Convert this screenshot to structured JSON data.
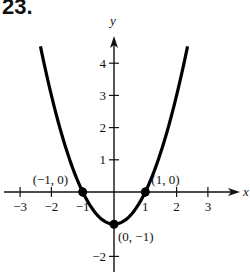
{
  "problem_number": "23.",
  "chart_data": {
    "type": "line",
    "title": "",
    "function": "y = x^2 - 1",
    "xlabel": "x",
    "ylabel": "y",
    "xlim": [
      -3.5,
      4
    ],
    "ylim": [
      -2.5,
      4.8
    ],
    "grid": false,
    "x_ticks": [
      -3,
      -2,
      -1,
      1,
      2,
      3
    ],
    "x_tick_labels": [
      "−3",
      "−2",
      "−1",
      "1",
      "2",
      "3"
    ],
    "y_ticks": [
      -2,
      1,
      2,
      3,
      4
    ],
    "y_tick_labels": [
      "−2",
      "1",
      "2",
      "3",
      "4"
    ],
    "series": [
      {
        "name": "parabola",
        "x": [
          -2.35,
          -2,
          -1.5,
          -1,
          -0.5,
          0,
          0.5,
          1,
          1.5,
          2,
          2.35
        ],
        "y": [
          4.52,
          3,
          1.25,
          0,
          -0.75,
          -1,
          -0.75,
          0,
          1.25,
          3,
          4.52
        ]
      }
    ],
    "points": [
      {
        "x": -1,
        "y": 0,
        "label": "(−1, 0)"
      },
      {
        "x": 1,
        "y": 0,
        "label": "(1, 0)"
      },
      {
        "x": 0,
        "y": -1,
        "label": "(0, −1)"
      }
    ]
  }
}
